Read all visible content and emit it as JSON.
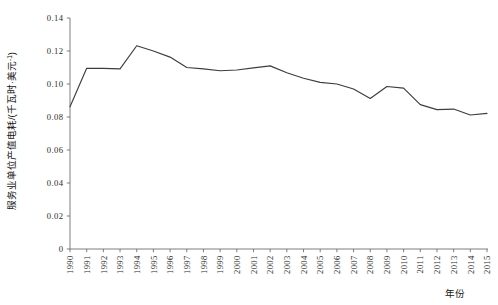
{
  "chart_data": {
    "type": "line",
    "title": "",
    "xlabel": "年份",
    "ylabel": "服务业单位产值电耗/(千瓦时·美元⁻¹)",
    "ylabel_main": "服务业单位产值电耗/(千瓦时·美元",
    "ylabel_sup": "-1",
    "ylabel_tail": ")",
    "xlim": [
      1990,
      2015
    ],
    "ylim": [
      0,
      0.14
    ],
    "grid": false,
    "legend": null,
    "categories": [
      "1990",
      "1991",
      "1992",
      "1993",
      "1994",
      "1995",
      "1996",
      "1997",
      "1998",
      "1999",
      "2000",
      "2001",
      "2002",
      "2003",
      "2004",
      "2005",
      "2006",
      "2007",
      "2008",
      "2009",
      "2010",
      "2011",
      "2012",
      "2013",
      "2014",
      "2015"
    ],
    "values": [
      0.0862,
      0.1095,
      0.1095,
      0.1092,
      0.1232,
      0.12,
      0.1163,
      0.11,
      0.1092,
      0.108,
      0.1085,
      0.1098,
      0.111,
      0.1068,
      0.1035,
      0.101,
      0.1,
      0.097,
      0.0912,
      0.0985,
      0.0975,
      0.0875,
      0.0845,
      0.0848,
      0.0812,
      0.0822
    ],
    "ytick_labels": [
      "0",
      "0.02",
      "0.04",
      "0.06",
      "0.08",
      "0.10",
      "0.12",
      "0.14"
    ],
    "ytick_values": [
      0,
      0.02,
      0.04,
      0.06,
      0.08,
      0.1,
      0.12,
      0.14
    ],
    "xtick_labels": [
      "1990",
      "1991",
      "1992",
      "1993",
      "1994",
      "1995",
      "1996",
      "1997",
      "1998",
      "1999",
      "2000",
      "2001",
      "2002",
      "2003",
      "2004",
      "2005",
      "2006",
      "2007",
      "2008",
      "2009",
      "2010",
      "2011",
      "2012",
      "2013",
      "2014",
      "2015"
    ],
    "line_color": "#3d3d3d",
    "axis_color": "#6f6f6f",
    "background_color": "#ffffff"
  }
}
